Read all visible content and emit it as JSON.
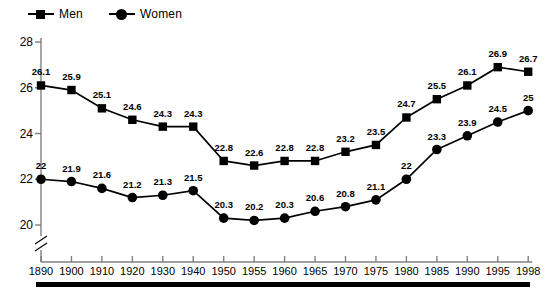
{
  "legend": {
    "position": "top-left",
    "entries": [
      {
        "label": "Men",
        "marker": "square-marker"
      },
      {
        "label": "Women",
        "marker": "circle-marker"
      }
    ]
  },
  "chart_data": {
    "type": "line",
    "title": "",
    "subtitle": "",
    "xlabel": "",
    "ylabel": "",
    "grid": false,
    "legend_position": "top-left",
    "axis_break": true,
    "ylim": [
      20,
      28
    ],
    "yticks": [
      "20",
      "22",
      "24",
      "26",
      "28"
    ],
    "categories": [
      "1890",
      "1900",
      "1910",
      "1920",
      "1930",
      "1940",
      "1950",
      "1955",
      "1960",
      "1965",
      "1970",
      "1975",
      "1980",
      "1985",
      "1990",
      "1995",
      "1998"
    ],
    "series": [
      {
        "name": "Men",
        "marker": "square",
        "color": "#000000",
        "values": [
          26.1,
          25.9,
          25.1,
          24.6,
          24.3,
          24.3,
          22.8,
          22.6,
          22.8,
          22.8,
          23.2,
          23.5,
          24.7,
          25.5,
          26.1,
          26.9,
          26.7
        ],
        "labels": [
          "26.1",
          "25.9",
          "25.1",
          "24.6",
          "24.3",
          "24.3",
          "22.8",
          "22.6",
          "22.8",
          "22.8",
          "23.2",
          "23.5",
          "24.7",
          "25.5",
          "26.1",
          "26.9",
          "26.7"
        ]
      },
      {
        "name": "Women",
        "marker": "circle",
        "color": "#000000",
        "values": [
          22,
          21.9,
          21.6,
          21.2,
          21.3,
          21.5,
          20.3,
          20.2,
          20.3,
          20.6,
          20.8,
          21.1,
          22,
          23.3,
          23.9,
          24.5,
          25
        ],
        "labels": [
          "22",
          "21.9",
          "21.6",
          "21.2",
          "21.3",
          "21.5",
          "20.3",
          "20.2",
          "20.3",
          "20.6",
          "20.8",
          "21.1",
          "22",
          "23.3",
          "23.9",
          "24.5",
          "25"
        ]
      }
    ]
  }
}
